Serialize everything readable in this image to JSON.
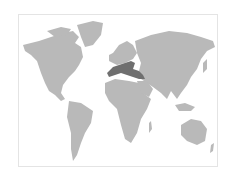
{
  "map": {
    "type": "world-map",
    "land_color": "#b9b9b9",
    "highlight_color": "#6f6f6f",
    "highlighted_region": "Southern Europe / Mediterranean"
  }
}
